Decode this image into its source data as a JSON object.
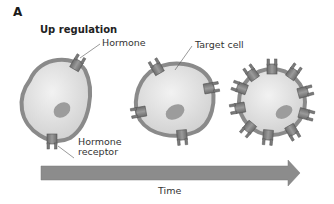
{
  "figure": {
    "panel_letter": "A",
    "title": "Up regulation",
    "labels": {
      "hormone": "Hormone",
      "target_cell": "Target cell",
      "hormone_receptor_line1": "Hormone",
      "hormone_receptor_line2": "receptor",
      "time": "Time"
    },
    "cells": [
      {
        "stage": 1,
        "receptor_count": 2
      },
      {
        "stage": 2,
        "receptor_count": 5
      },
      {
        "stage": 3,
        "receptor_count": 12
      }
    ],
    "arrow": {
      "direction": "right",
      "label": "Time"
    },
    "colors": {
      "membrane": "#8a8a8a",
      "cytoplasm": "#e4e4e4",
      "nucleus": "#9a9a9a",
      "receptor": "#7c7c7c",
      "arrow": "#8c8c8c",
      "text": "#333333"
    }
  }
}
